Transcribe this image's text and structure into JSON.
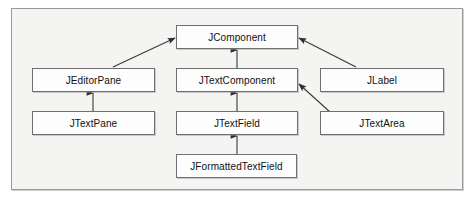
{
  "diagram": {
    "type": "uml-class-hierarchy",
    "title": "",
    "frame": {
      "border_color": "#9a9a9a",
      "background": "#f4f4f3"
    },
    "box_style": {
      "fill": "#fdfdfd",
      "border_color": "#6f6f6f",
      "text_color": "#111111"
    },
    "connector_color": "#3a3a3a",
    "nodes": [
      {
        "id": "jcomponent",
        "label": "JComponent"
      },
      {
        "id": "jeditorpane",
        "label": "JEditorPane"
      },
      {
        "id": "jtextcomponent",
        "label": "JTextComponent"
      },
      {
        "id": "jlabel",
        "label": "JLabel"
      },
      {
        "id": "jtextpane",
        "label": "JTextPane"
      },
      {
        "id": "jtextfield",
        "label": "JTextField"
      },
      {
        "id": "jtextarea",
        "label": "JTextArea"
      },
      {
        "id": "jformattedtextfield",
        "label": "JFormattedTextField"
      }
    ],
    "edges": [
      {
        "from": "jeditorpane",
        "to": "jcomponent",
        "relation": "extends"
      },
      {
        "from": "jtextcomponent",
        "to": "jcomponent",
        "relation": "extends"
      },
      {
        "from": "jlabel",
        "to": "jcomponent",
        "relation": "extends"
      },
      {
        "from": "jtextpane",
        "to": "jeditorpane",
        "relation": "extends"
      },
      {
        "from": "jtextfield",
        "to": "jtextcomponent",
        "relation": "extends"
      },
      {
        "from": "jtextarea",
        "to": "jtextcomponent",
        "relation": "extends"
      },
      {
        "from": "jformattedtextfield",
        "to": "jtextfield",
        "relation": "extends"
      }
    ]
  }
}
